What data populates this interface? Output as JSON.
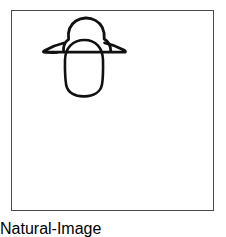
{
  "canvas": {
    "width": 226,
    "height": 220,
    "background_color": "#ffffff",
    "description": "Hand-drawn black line sketch on a white page inside a thin rectangular frame"
  },
  "frame": {
    "name": "picture-frame",
    "x": 11,
    "y": 10,
    "width": 203,
    "height": 201,
    "border_color": "#4a4a4a",
    "border_width": 1,
    "fill_color": "#ffffff"
  },
  "drawing": {
    "title": "hat-over-oval-sketch",
    "stroke_color": "#111111",
    "stroke_width": 2.6,
    "fill_color": "none",
    "parts": [
      {
        "name": "hat-crown-dome",
        "shape": "dome",
        "top_y": 18,
        "left_x": 63,
        "right_x": 111,
        "bottom_y": 52
      },
      {
        "name": "hat-brim",
        "shape": "flared-ellipse-wedge",
        "left_tip_x": 43,
        "right_tip_x": 125,
        "line_y": 52
      },
      {
        "name": "face-oval",
        "shape": "vertical-oval",
        "center_x": 84,
        "top_y": 40,
        "bottom_y": 96,
        "left_x": 65,
        "right_x": 103
      }
    ]
  }
}
